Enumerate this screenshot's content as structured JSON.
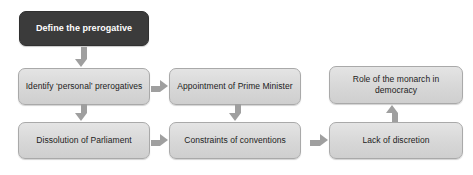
{
  "diagram": {
    "type": "flowchart",
    "title": "",
    "background_color": "#ffffff",
    "palette": {
      "root_fill": "#3b3b3b",
      "root_text": "#ffffff",
      "node_fill": "#d7d7d7",
      "node_border": "#a9a9a9",
      "node_text": "#1c1c1c",
      "arrow": "#9f9f9f"
    },
    "nodes": [
      {
        "id": "define-the-prerogative",
        "label": "Define the prerogative",
        "style": "dark",
        "x": 19,
        "y": 11,
        "w": 130,
        "h": 35
      },
      {
        "id": "identify-personal-prerogatives",
        "label": "Identify ‘personal’ prerogatives",
        "style": "light",
        "x": 18,
        "y": 68,
        "w": 132,
        "h": 37
      },
      {
        "id": "appointment-of-prime-minister",
        "label": "Appointment of Prime Minister",
        "style": "light",
        "x": 169,
        "y": 68,
        "w": 132,
        "h": 37
      },
      {
        "id": "role-of-the-monarch-in-democracy",
        "label": "Role of the monarch in\ndemocracy",
        "style": "light",
        "x": 329,
        "y": 66,
        "w": 134,
        "h": 38
      },
      {
        "id": "dissolution-of-parliament",
        "label": "Dissolution of Parliament",
        "style": "light",
        "x": 18,
        "y": 122,
        "w": 132,
        "h": 37
      },
      {
        "id": "constraints-of-conventions",
        "label": "Constraints of conventions",
        "style": "light",
        "x": 169,
        "y": 122,
        "w": 132,
        "h": 37
      },
      {
        "id": "lack-of-discretion",
        "label": "Lack of discretion",
        "style": "light",
        "x": 329,
        "y": 122,
        "w": 134,
        "h": 37
      }
    ],
    "arrows": [
      {
        "id": "define-to-identify",
        "direction": "down",
        "from": "define-the-prerogative",
        "to": "identify-personal-prerogatives",
        "x": 78,
        "y": 47,
        "len": 20
      },
      {
        "id": "identify-to-dissolution",
        "direction": "down",
        "from": "identify-personal-prerogatives",
        "to": "dissolution-of-parliament",
        "x": 78,
        "y": 104,
        "len": 17
      },
      {
        "id": "identify-to-appointment",
        "direction": "right",
        "from": "identify-personal-prerogatives",
        "to": "appointment-of-prime-minister",
        "x": 151,
        "y": 83,
        "len": 17
      },
      {
        "id": "appointment-to-constraints",
        "direction": "down",
        "from": "appointment-of-prime-minister",
        "to": "constraints-of-conventions",
        "x": 232,
        "y": 104,
        "len": 17
      },
      {
        "id": "dissolution-to-constraints",
        "direction": "right",
        "from": "dissolution-of-parliament",
        "to": "constraints-of-conventions",
        "x": 151,
        "y": 137,
        "len": 17
      },
      {
        "id": "constraints-to-lack",
        "direction": "right",
        "from": "constraints-of-conventions",
        "to": "lack-of-discretion",
        "x": 310,
        "y": 137,
        "len": 18
      },
      {
        "id": "lack-to-role",
        "direction": "up",
        "from": "lack-of-discretion",
        "to": "role-of-the-monarch-in-democracy",
        "x": 389,
        "y": 105,
        "len": 17
      }
    ]
  }
}
